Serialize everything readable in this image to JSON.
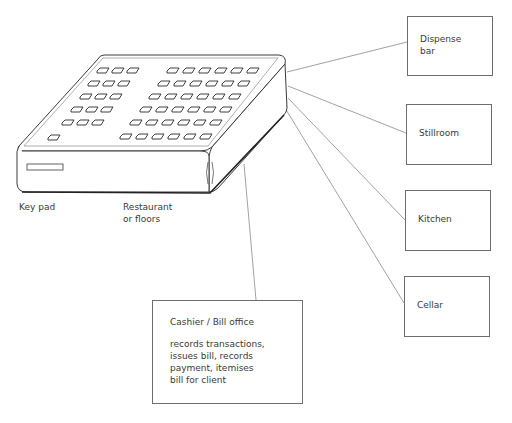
{
  "diagram": {
    "type": "flow",
    "central_device": {
      "name": "Key pad",
      "location_label": "Restaurant\nor floors"
    },
    "labels": {
      "keypad": "Key pad",
      "restaurant_line1": "Restaurant",
      "restaurant_line2": "or floors"
    },
    "destinations": [
      {
        "id": "dispense-bar",
        "line1": "Dispense",
        "line2": "bar"
      },
      {
        "id": "stillroom",
        "line1": "Stillroom"
      },
      {
        "id": "kitchen",
        "line1": "Kitchen"
      },
      {
        "id": "cellar",
        "line1": "Cellar"
      }
    ],
    "cashier": {
      "title": "Cashier / Bill office",
      "description": "records transactions,\nissues bill, records\npayment, itemises\nbill for client"
    },
    "connections": [
      {
        "from": "keypad",
        "to": "dispense-bar"
      },
      {
        "from": "keypad",
        "to": "stillroom"
      },
      {
        "from": "keypad",
        "to": "kitchen"
      },
      {
        "from": "keypad",
        "to": "cellar"
      },
      {
        "from": "keypad",
        "to": "cashier"
      }
    ],
    "colors": {
      "line": "#8a8a8a",
      "outline": "#3a3a3a",
      "box_border": "#6d6d6d",
      "text": "#3a3a3a"
    }
  }
}
